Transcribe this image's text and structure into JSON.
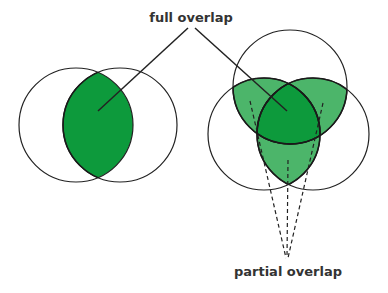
{
  "labels": {
    "full_overlap": "full overlap",
    "partial_overlap": "partial overlap"
  },
  "colors": {
    "full_overlap_fill": "#0d9a3c",
    "partial_overlap_fill": "#4cb56a",
    "stroke": "#222222",
    "background": "#ffffff"
  },
  "diagrams": [
    {
      "name": "two-circle-venn",
      "circles": 2,
      "highlight": "full overlap (intersection)"
    },
    {
      "name": "three-circle-venn",
      "circles": 3,
      "highlight": "full overlap (triple intersection) and partial overlaps (pairwise intersections)"
    }
  ]
}
